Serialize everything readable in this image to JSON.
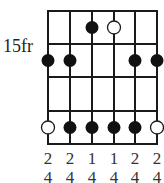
{
  "diagram": {
    "type": "guitar-scale-chord-diagram",
    "fret_label": "15fr",
    "strings": 6,
    "frets_shown": 4,
    "string_x": [
      48,
      70,
      92,
      114,
      135,
      157
    ],
    "fret_y": [
      11,
      44,
      77,
      111,
      144
    ],
    "dots": [
      {
        "string": 3,
        "fret": 1,
        "style": "filled"
      },
      {
        "string": 4,
        "fret": 1,
        "style": "open"
      },
      {
        "string": 1,
        "fret": 2,
        "style": "filled"
      },
      {
        "string": 2,
        "fret": 2,
        "style": "filled"
      },
      {
        "string": 5,
        "fret": 2,
        "style": "filled"
      },
      {
        "string": 6,
        "fret": 2,
        "style": "filled"
      },
      {
        "string": 1,
        "fret": 4,
        "style": "open"
      },
      {
        "string": 2,
        "fret": 4,
        "style": "filled"
      },
      {
        "string": 3,
        "fret": 4,
        "style": "filled"
      },
      {
        "string": 4,
        "fret": 4,
        "style": "filled"
      },
      {
        "string": 5,
        "fret": 4,
        "style": "filled"
      },
      {
        "string": 6,
        "fret": 4,
        "style": "open"
      }
    ],
    "fingering_row1": [
      "2",
      "2",
      "1",
      "1",
      "2",
      "2"
    ],
    "fingering_row2": [
      "4",
      "4",
      "4",
      "4",
      "4",
      "4"
    ],
    "colors": {
      "line": "#1a1a1a",
      "dot": "#111111",
      "open_fill": "#ffffff"
    }
  }
}
